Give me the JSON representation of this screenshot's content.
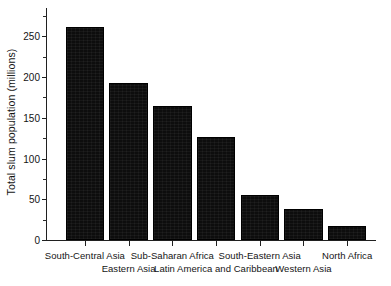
{
  "chart_data": {
    "type": "bar",
    "title": "",
    "subtitle": "",
    "xlabel": "",
    "ylabel": "Total slum population (millions)",
    "ylim": [
      0,
      275
    ],
    "xlim": [
      0,
      7
    ],
    "grid": false,
    "legend": null,
    "legend_position": "none",
    "orientation": "vertical",
    "bar_color": "#0d0d0d",
    "label_stagger": true,
    "categories": [
      "South-Central Asia",
      "Eastern Asia",
      "Sub-Saharan Africa",
      "Latin America and Caribbean",
      "South-Eastern Asia",
      "Western Asia",
      "North Africa"
    ],
    "values": [
      262,
      193,
      164,
      126,
      55,
      38,
      17
    ],
    "units": "millions",
    "ytick_values": [
      0,
      50,
      100,
      150,
      200,
      250
    ],
    "ytick_labels": [
      "0",
      "50",
      "100",
      "150",
      "200",
      "250"
    ],
    "yminor_tick_values": [
      25,
      75,
      125,
      175,
      225,
      275
    ],
    "annotations": []
  },
  "axes": {
    "y_title": "Total slum population (millions)"
  },
  "colors": {
    "bar": "#0d0d0d",
    "axis": "#202020",
    "text": "#141414",
    "background": "#ffffff"
  }
}
